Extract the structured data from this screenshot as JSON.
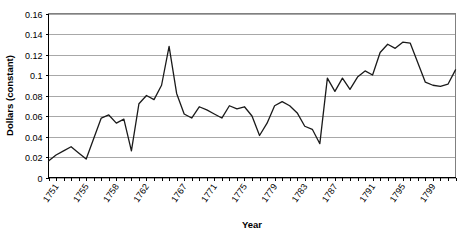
{
  "chart_data": {
    "type": "line",
    "title": "",
    "xlabel": "Year",
    "ylabel": "Dollars (constant)",
    "ylim": [
      0,
      0.16
    ],
    "ytick_values": [
      0,
      0.02,
      0.04,
      0.06,
      0.08,
      0.1,
      0.12,
      0.14,
      0.16
    ],
    "ytick_labels": [
      "0",
      "0.02",
      "0.04",
      "0.06",
      "0.08",
      "0.1",
      "0.12",
      "0.14",
      "0.16"
    ],
    "grid": true,
    "legend": "none",
    "xlim": [
      1750,
      1800
    ],
    "xtick_labels": [
      "1751",
      "1755",
      "1758",
      "1762",
      "1767",
      "1771",
      "1775",
      "1779",
      "1783",
      "1787",
      "1791",
      "1795",
      "1799"
    ],
    "x": [
      1750,
      1751,
      1752,
      1753,
      1754,
      1755,
      1756,
      1757,
      1758,
      1759,
      1760,
      1761,
      1762,
      1763,
      1764,
      1765,
      1766,
      1767,
      1768,
      1769,
      1770,
      1771,
      1772,
      1773,
      1774,
      1775,
      1776,
      1777,
      1778,
      1779,
      1780,
      1781,
      1782,
      1783,
      1784,
      1785,
      1786,
      1787,
      1788,
      1789,
      1790,
      1791,
      1792,
      1793,
      1794,
      1795,
      1796,
      1797,
      1798,
      1799,
      1800
    ],
    "values": [
      0.016,
      0.022,
      0.026,
      0.03,
      0.024,
      0.018,
      0.038,
      0.058,
      0.061,
      0.053,
      0.057,
      0.026,
      0.072,
      0.08,
      0.076,
      0.09,
      0.128,
      0.082,
      0.062,
      0.058,
      0.069,
      0.066,
      0.062,
      0.058,
      0.07,
      0.067,
      0.069,
      0.06,
      0.041,
      0.053,
      0.07,
      0.074,
      0.07,
      0.063,
      0.05,
      0.047,
      0.033,
      0.097,
      0.084,
      0.097,
      0.086,
      0.098,
      0.104,
      0.1,
      0.122,
      0.13,
      0.126,
      0.132,
      0.131,
      0.112,
      0.093
    ],
    "series": [
      {
        "name": "Dollars (constant)",
        "values": [
          0.016,
          0.022,
          0.026,
          0.03,
          0.024,
          0.018,
          0.038,
          0.058,
          0.061,
          0.053,
          0.057,
          0.026,
          0.072,
          0.08,
          0.076,
          0.09,
          0.128,
          0.082,
          0.062,
          0.058,
          0.069,
          0.066,
          0.062,
          0.058,
          0.07,
          0.067,
          0.069,
          0.06,
          0.041,
          0.053,
          0.07,
          0.074,
          0.07,
          0.063,
          0.05,
          0.047,
          0.033,
          0.097,
          0.084,
          0.097,
          0.086,
          0.098,
          0.104,
          0.1,
          0.122,
          0.13,
          0.126,
          0.132,
          0.131,
          0.112,
          0.093
        ]
      }
    ],
    "line_color": "#1a1a1a",
    "grid_color": "#a8a8a8",
    "background_color": "#ffffff"
  },
  "extra_points": {
    "tail": [
      0.09,
      0.089,
      0.091,
      0.105
    ]
  }
}
